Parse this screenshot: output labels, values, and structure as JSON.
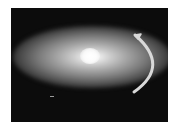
{
  "image": {
    "description": "Bright elliptical galaxy-like glow on a dark background with a curved white arrow on the right indicating rotation",
    "colors": {
      "background": "#0c0c0c",
      "glow_core": "#ffffff",
      "arrow": "#d8d8d8"
    }
  }
}
